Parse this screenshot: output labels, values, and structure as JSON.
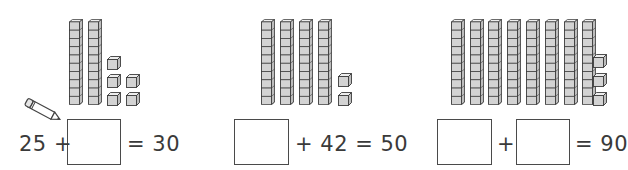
{
  "problems": [
    {
      "id": "problem-1",
      "tens": 2,
      "ones": 5,
      "ones_layout": [
        [
          107,
          55
        ],
        [
          107,
          73
        ],
        [
          126,
          73
        ],
        [
          107,
          91
        ],
        [
          126,
          91
        ]
      ],
      "rods_x": [
        69,
        88
      ],
      "equation": {
        "left_text": "25 +",
        "right_text": "= 30"
      },
      "boxes": [
        {
          "x": 67,
          "y": 119,
          "w": 54,
          "h": 46
        }
      ],
      "answer": ""
    },
    {
      "id": "problem-2",
      "tens": 4,
      "ones": 2,
      "ones_layout": [
        [
          338,
          72
        ],
        [
          338,
          91
        ]
      ],
      "rods_x": [
        261,
        280,
        299,
        318
      ],
      "equation": {
        "right_text": "+ 42 = 50"
      },
      "boxes": [
        {
          "x": 234,
          "y": 119,
          "w": 55,
          "h": 46
        }
      ],
      "answer": ""
    },
    {
      "id": "problem-3",
      "tens": 8,
      "ones": 3,
      "ones_layout": [
        [
          593,
          53
        ],
        [
          593,
          72
        ],
        [
          593,
          91
        ]
      ],
      "rods_x": [
        451,
        470,
        488,
        507,
        526,
        545,
        564,
        582
      ],
      "equation": {
        "middle_text": "+",
        "right_text": "= 90"
      },
      "boxes": [
        {
          "x": 437,
          "y": 119,
          "w": 55,
          "h": 46
        },
        {
          "x": 516,
          "y": 119,
          "w": 54,
          "h": 46
        }
      ],
      "answer": ""
    }
  ],
  "icons": {
    "pencil": "pencil-icon"
  },
  "colors": {
    "cube_face": "#d3d3d3",
    "cube_outline": "#3c3c3c",
    "text": "#3a3a3a"
  }
}
